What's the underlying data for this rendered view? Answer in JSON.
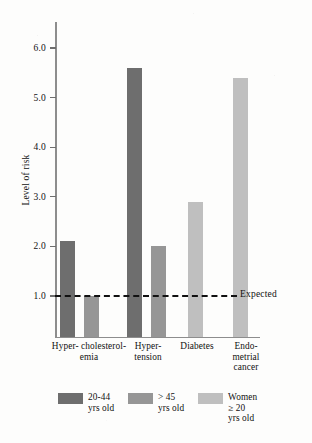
{
  "chart_data": {
    "type": "bar",
    "title": "",
    "xlabel": "",
    "ylabel": "Level of risk",
    "ylim": [
      0,
      6.3
    ],
    "yticks": [
      1.0,
      2.0,
      3.0,
      4.0,
      5.0,
      6.0
    ],
    "ytick_labels": [
      "1.0",
      "2.0",
      "3.0",
      "4.0",
      "5.0",
      "6.0"
    ],
    "grid": false,
    "legend_position": "bottom",
    "categories": [
      "Hyper-\ncholesterol-\nemia",
      "Hyper-\ntension",
      "Diabetes",
      "Endo-\nmetrial\ncancer"
    ],
    "series": [
      {
        "name": "20-44\nyrs old",
        "color": "#6e6e6e",
        "values": [
          2.1,
          5.6,
          null,
          null
        ]
      },
      {
        "name": "> 45\nyrs old",
        "color": "#969696",
        "values": [
          1.0,
          2.0,
          null,
          null
        ]
      },
      {
        "name": "Women\n≥ 20\nyrs old",
        "color": "#bfbfbf",
        "values": [
          null,
          null,
          2.9,
          5.4
        ]
      }
    ],
    "reference_line": {
      "label": "Expected",
      "value": 1.0,
      "style": "dashed",
      "color": "#111111"
    },
    "bars": [
      {
        "category": "Hyper-cholesterolemia",
        "series": "20-44 yrs old",
        "value": 2.1,
        "color": "#6e6e6e",
        "x": 60,
        "width": 15
      },
      {
        "category": "Hyper-cholesterolemia",
        "series": "> 45 yrs old",
        "value": 1.0,
        "color": "#969696",
        "x": 84,
        "width": 15
      },
      {
        "category": "Hypertension",
        "series": "20-44 yrs old",
        "value": 5.6,
        "color": "#6e6e6e",
        "x": 127,
        "width": 15
      },
      {
        "category": "Hypertension",
        "series": "> 45 yrs old",
        "value": 2.0,
        "color": "#969696",
        "x": 151,
        "width": 15
      },
      {
        "category": "Diabetes",
        "series": "Women ≥ 20 yrs old",
        "value": 2.9,
        "color": "#bfbfbf",
        "x": 188,
        "width": 15
      },
      {
        "category": "Endometrial cancer",
        "series": "Women ≥ 20 yrs old",
        "value": 5.4,
        "color": "#bfbfbf",
        "x": 233,
        "width": 15
      }
    ]
  },
  "axis": {
    "y_title": "Level of risk",
    "ticks": [
      "6.0",
      "5.0",
      "4.0",
      "3.0",
      "2.0",
      "1.0"
    ]
  },
  "categories": {
    "c0": "Hyper-\ncholesterol-\nemia",
    "c1": "Hyper-\ntension",
    "c2": "Diabetes",
    "c3": "Endo-\nmetrial\ncancer"
  },
  "reference": {
    "label": "Expected"
  },
  "legend": {
    "items": [
      {
        "label": "20-44\nyrs old",
        "color": "#6e6e6e"
      },
      {
        "label": "> 45\nyrs old",
        "color": "#969696"
      },
      {
        "label": "Women\n≥ 20\nyrs old",
        "color": "#bfbfbf"
      }
    ]
  }
}
